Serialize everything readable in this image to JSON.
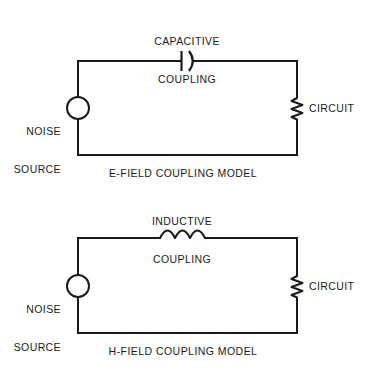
{
  "figure": {
    "background_color": "#ffffff",
    "line_color": "#1a1a1a",
    "text_color": "#1a1a1a"
  },
  "diagrams": [
    {
      "id": "e-field",
      "caption": "E-FIELD COUPLING MODEL",
      "coupling_label_line1": "CAPACITIVE",
      "coupling_label_line2": "COUPLING",
      "coupling_symbol": "capacitor",
      "source_label_line1": "NOISE",
      "source_label_line2": "SOURCE",
      "source_symbol": "circle",
      "load_label": "CIRCUIT",
      "load_symbol": "resistor"
    },
    {
      "id": "h-field",
      "caption": "H-FIELD COUPLING MODEL",
      "coupling_label_line1": "INDUCTIVE",
      "coupling_label_line2": "COUPLING",
      "coupling_symbol": "inductor",
      "source_label_line1": "NOISE",
      "source_label_line2": "SOURCE",
      "source_symbol": "circle",
      "load_label": "CIRCUIT",
      "load_symbol": "resistor"
    }
  ]
}
